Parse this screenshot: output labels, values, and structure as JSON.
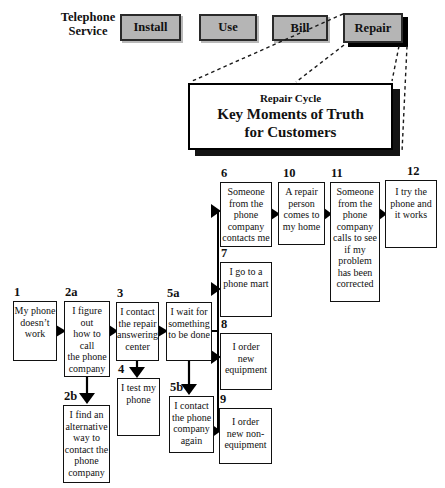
{
  "header": {
    "service_label": "Telephone\nService",
    "stages": [
      {
        "label": "Install"
      },
      {
        "label": "Use"
      },
      {
        "label": "Bill"
      },
      {
        "label": "Repair"
      }
    ]
  },
  "cycle_banner": {
    "title": "Repair Cycle",
    "line1": "Key Moments of Truth",
    "line2": "for Customers"
  },
  "flow": {
    "b1": {
      "num": "1",
      "text": "My phone\ndoesn’t\nwork"
    },
    "b2a": {
      "num": "2a",
      "text": "I figure out\nhow to call\nthe phone\ncompany"
    },
    "b2b": {
      "num": "2b",
      "text": "I find an\nalternative\nway to\ncontact the\nphone\ncompany"
    },
    "b3": {
      "num": "3",
      "text": "I contact\nthe repair\nanswering\ncenter"
    },
    "b4": {
      "num": "4",
      "text": "I test my\nphone"
    },
    "b5a": {
      "num": "5a",
      "text": "I wait for\nsomething\nto be done"
    },
    "b5b": {
      "num": "5b",
      "text": "I contact\nthe phone\ncompany\nagain"
    },
    "b6": {
      "num": "6",
      "text": "Someone\nfrom the\nphone\ncompany\ncontacts me"
    },
    "b7": {
      "num": "7",
      "text": "I go to a\nphone mart"
    },
    "b8": {
      "num": "8",
      "text": "I order\nnew\nequipment"
    },
    "b9": {
      "num": "9",
      "text": "I order\nnew non-\nequipment"
    },
    "b10": {
      "num": "10",
      "text": "A repair\nperson\ncomes to\nmy home"
    },
    "b11": {
      "num": "11",
      "text": "Someone\nfrom the\nphone\ncompany\ncalls to see\nif my\nproblem\nhas been\ncorrected"
    },
    "b12": {
      "num": "12",
      "text": "I try the\nphone and\nit works"
    }
  },
  "colors": {
    "stage_fill": "#b5b5b5",
    "line": "#111111",
    "shadow": "#000000",
    "background": "#ffffff"
  }
}
